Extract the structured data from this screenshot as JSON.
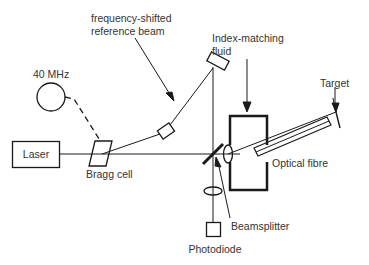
{
  "diagram": {
    "colors": {
      "line": "#1a1a1a",
      "text": "#333333",
      "background": "#ffffff"
    },
    "components": {
      "laser": {
        "label": "Laser"
      },
      "oscillator": {
        "label": "40 MHz"
      },
      "bragg_cell": {
        "label": "Bragg cell"
      },
      "reference_beam": {
        "label_line1": "frequency-shifted",
        "label_line2": "reference beam"
      },
      "fluid": {
        "label_line1": "Index-matching",
        "label_line2": "fluid"
      },
      "target": {
        "label": "Target"
      },
      "fibre": {
        "label": "Optical fibre"
      },
      "beamsplitter": {
        "label": "Beamsplitter"
      },
      "photodiode": {
        "label": "Photodiode"
      }
    }
  }
}
